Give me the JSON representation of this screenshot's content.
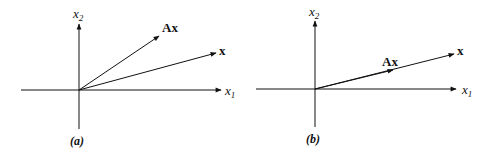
{
  "figure": {
    "panels": [
      {
        "id": "a",
        "caption": "(a)",
        "axis_x_label": "x",
        "axis_x_sub": "1",
        "axis_y_label": "x",
        "axis_y_sub": "2",
        "vectors": [
          {
            "name": "x",
            "label": "x"
          },
          {
            "name": "Ax",
            "label": "Ax"
          }
        ]
      },
      {
        "id": "b",
        "caption": "(b)",
        "axis_x_label": "x",
        "axis_x_sub": "1",
        "axis_y_label": "x",
        "axis_y_sub": "2",
        "vectors": [
          {
            "name": "x",
            "label": "x"
          },
          {
            "name": "Ax",
            "label": "Ax"
          }
        ]
      }
    ],
    "colors": {
      "stroke": "#111111",
      "background": "#ffffff"
    }
  }
}
